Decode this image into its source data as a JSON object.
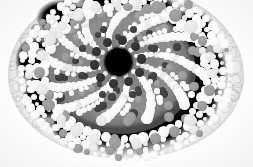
{
  "image": {
    "kind": "light-micrograph",
    "subject": "plant-stem-cross-section",
    "modality": "brightfield-grayscale",
    "width_px": 253,
    "height_px": 167,
    "background_color": "#ffffff",
    "description": "Grayscale transverse section of a monocot stem/root showing a pale outer cortex, a black lacunar ring studded with bright circular cells, a mid-grey central stele with radiating spiral files of bright cells, a ring of dark metaxylem vessels and a large black central cavity."
  },
  "palette": {
    "background": "#ffffff",
    "cortex_light": "#e4e4e4",
    "cortex_mid": "#cfcfcf",
    "dark_ring": "#050505",
    "stele_gray": "#888888",
    "bright_cell": "#ffffff",
    "pale_cell": "#ececec",
    "mid_cell": "#9b9b9b",
    "dark_cell": "#3a3a3a",
    "vessel": "#2b2b2b",
    "central_cavity": "#000000"
  },
  "structures": [
    {
      "name": "background",
      "label": "Slide background",
      "tone": "white"
    },
    {
      "name": "cortex",
      "label": "Outer cortex / parenchyma",
      "tone": "light gray"
    },
    {
      "name": "lacuna-ring",
      "label": "Dark lacunar ring",
      "tone": "black"
    },
    {
      "name": "stele",
      "label": "Central stele",
      "tone": "mid gray"
    },
    {
      "name": "metaxylem-ring",
      "label": "Metaxylem vessel ring",
      "tone": "dark gray"
    },
    {
      "name": "central-cavity",
      "label": "Central pith cavity",
      "tone": "black"
    }
  ],
  "geometry": {
    "specimen": {
      "cx": 126,
      "cy": 72,
      "rx": 118,
      "ry": 86
    },
    "dark_ring": {
      "cx": 126,
      "cy": 73,
      "rx": 102,
      "ry": 83
    },
    "stele": {
      "cx": 121,
      "cy": 71,
      "rx": 75,
      "ry": 63
    },
    "central_cavity": {
      "cx": 118,
      "cy": 62,
      "r": 13
    },
    "vessel_ring": {
      "cx": 118,
      "cy": 62,
      "r": 24,
      "count": 10
    },
    "ray_count": 12
  },
  "cortex_cells": [
    {
      "x": 20,
      "y": 30,
      "r": 6.5
    },
    {
      "x": 32,
      "y": 22,
      "r": 5.5
    },
    {
      "x": 14,
      "y": 44,
      "r": 6
    },
    {
      "x": 27,
      "y": 40,
      "r": 6.8
    },
    {
      "x": 40,
      "y": 32,
      "r": 5
    },
    {
      "x": 11,
      "y": 58,
      "r": 6.2
    },
    {
      "x": 24,
      "y": 56,
      "r": 6.6
    },
    {
      "x": 37,
      "y": 48,
      "r": 5.4
    },
    {
      "x": 10,
      "y": 72,
      "r": 6
    },
    {
      "x": 22,
      "y": 71,
      "r": 6.4
    },
    {
      "x": 35,
      "y": 64,
      "r": 5.6
    },
    {
      "x": 12,
      "y": 86,
      "r": 5.8
    },
    {
      "x": 24,
      "y": 86,
      "r": 6.1
    },
    {
      "x": 36,
      "y": 80,
      "r": 5.2
    },
    {
      "x": 17,
      "y": 100,
      "r": 5.4
    },
    {
      "x": 29,
      "y": 99,
      "r": 5.6
    },
    {
      "x": 41,
      "y": 94,
      "r": 4.8
    },
    {
      "x": 25,
      "y": 112,
      "r": 4.8
    },
    {
      "x": 37,
      "y": 110,
      "r": 4.9
    },
    {
      "x": 49,
      "y": 105,
      "r": 4.4
    },
    {
      "x": 36,
      "y": 122,
      "r": 4.2
    },
    {
      "x": 48,
      "y": 119,
      "r": 4.3
    },
    {
      "x": 60,
      "y": 114,
      "r": 4.0
    },
    {
      "x": 48,
      "y": 16,
      "r": 5.0
    },
    {
      "x": 58,
      "y": 10,
      "r": 4.6
    },
    {
      "x": 44,
      "y": 26,
      "r": 4.6
    },
    {
      "x": 206,
      "y": 30,
      "r": 5.6
    },
    {
      "x": 218,
      "y": 40,
      "r": 6.0
    },
    {
      "x": 229,
      "y": 52,
      "r": 5.6
    },
    {
      "x": 234,
      "y": 66,
      "r": 5.8
    },
    {
      "x": 236,
      "y": 80,
      "r": 5.6
    },
    {
      "x": 232,
      "y": 94,
      "r": 5.4
    },
    {
      "x": 224,
      "y": 106,
      "r": 5.2
    },
    {
      "x": 213,
      "y": 118,
      "r": 5.0
    },
    {
      "x": 200,
      "y": 127,
      "r": 4.8
    },
    {
      "x": 220,
      "y": 70,
      "r": 5.4
    },
    {
      "x": 214,
      "y": 56,
      "r": 5.2
    },
    {
      "x": 210,
      "y": 90,
      "r": 5.2
    },
    {
      "x": 200,
      "y": 110,
      "r": 4.8
    },
    {
      "x": 186,
      "y": 126,
      "r": 4.6
    },
    {
      "x": 172,
      "y": 134,
      "r": 4.4
    },
    {
      "x": 156,
      "y": 138,
      "r": 4.2
    },
    {
      "x": 140,
      "y": 141,
      "r": 4.2
    },
    {
      "x": 124,
      "y": 142,
      "r": 4.2
    },
    {
      "x": 108,
      "y": 141,
      "r": 4.2
    },
    {
      "x": 92,
      "y": 138,
      "r": 4.2
    },
    {
      "x": 76,
      "y": 132,
      "r": 4.2
    },
    {
      "x": 62,
      "y": 125,
      "r": 4.2
    },
    {
      "x": 196,
      "y": 20,
      "r": 5.0
    },
    {
      "x": 186,
      "y": 12,
      "r": 4.6
    }
  ],
  "ray_cells_note": "Twelve radiating files of bright circular cells fan out from the metaxylem ring to the lacunar ring; cell diameter grows from ~3px near the centre to ~7px near the periphery.",
  "lacuna_blobs": [
    {
      "x": 62,
      "y": 18,
      "rx": 26,
      "ry": 19
    },
    {
      "x": 104,
      "y": 6,
      "rx": 24,
      "ry": 16
    },
    {
      "x": 152,
      "y": 10,
      "rx": 24,
      "ry": 17
    },
    {
      "x": 192,
      "y": 30,
      "rx": 24,
      "ry": 20
    },
    {
      "x": 206,
      "y": 66,
      "rx": 20,
      "ry": 22
    },
    {
      "x": 196,
      "y": 104,
      "rx": 22,
      "ry": 20
    },
    {
      "x": 160,
      "y": 126,
      "rx": 25,
      "ry": 17
    },
    {
      "x": 116,
      "y": 132,
      "rx": 26,
      "ry": 16
    },
    {
      "x": 74,
      "y": 126,
      "rx": 24,
      "ry": 17
    },
    {
      "x": 42,
      "y": 98,
      "rx": 20,
      "ry": 22
    },
    {
      "x": 34,
      "y": 60,
      "rx": 19,
      "ry": 23
    }
  ]
}
